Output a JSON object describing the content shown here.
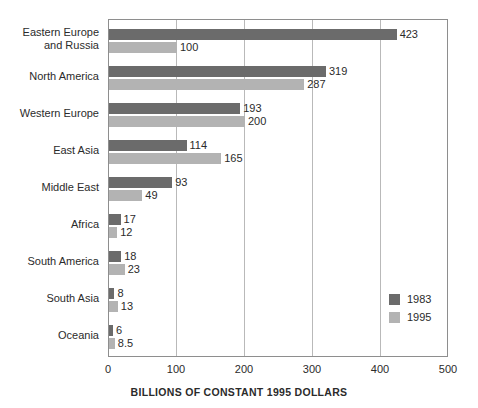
{
  "chart_data": {
    "type": "bar",
    "orientation": "horizontal",
    "title": "",
    "xlabel": "BILLIONS OF CONSTANT 1995 DOLLARS",
    "ylabel": "",
    "xlim": [
      0,
      500
    ],
    "xticks": [
      0,
      100,
      200,
      300,
      400,
      500
    ],
    "xtick_labels": [
      "0",
      "100",
      "200",
      "300",
      "400",
      "500"
    ],
    "grid": "vertical",
    "legend_position": "inside-lower-right",
    "categories": [
      "Eastern Europe\nand Russia",
      "North America",
      "Western Europe",
      "East Asia",
      "Middle East",
      "Africa",
      "South America",
      "South Asia",
      "Oceania"
    ],
    "series": [
      {
        "name": "1983",
        "color": "#6b6b6b",
        "values": [
          423,
          319,
          193,
          114,
          93,
          17,
          18,
          8,
          6
        ],
        "labels": [
          "423",
          "319",
          "193",
          "114",
          "93",
          "17",
          "18",
          "8",
          "6"
        ]
      },
      {
        "name": "1995",
        "color": "#b3b3b3",
        "values": [
          100,
          287,
          200,
          165,
          49,
          12,
          23,
          13,
          8.5
        ],
        "labels": [
          "100",
          "287",
          "200",
          "165",
          "49",
          "12",
          "23",
          "13",
          "8.5"
        ]
      }
    ]
  },
  "legend": {
    "items": [
      {
        "label": "1983",
        "color": "#6b6b6b"
      },
      {
        "label": "1995",
        "color": "#b3b3b3"
      }
    ]
  },
  "colors": {
    "series_1983": "#6b6b6b",
    "series_1995": "#b3b3b3",
    "frame": "#8e8e8e",
    "gridline": "#b9b9b9",
    "text": "#2b2b2b",
    "background": "#ffffff"
  }
}
